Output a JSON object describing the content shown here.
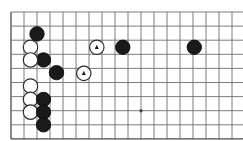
{
  "diagram": {
    "kind": "go-board-diagram",
    "board": {
      "columns": 18,
      "rows": 9,
      "origin_x": 11,
      "origin_y": 12,
      "col_spacing": 13,
      "row_spacing": 14.1,
      "line_color": "#6e6e6e",
      "edge_color": "#4a4a4a",
      "line_width": 0.9,
      "edge_width": 1.3,
      "background": "#ffffff",
      "left_edge_is_board_edge": true,
      "bottom_edge_is_board_edge": true
    },
    "colors": {
      "black_stone_fill": "#1a1a1a",
      "black_stone_edge": "#000000",
      "white_stone_fill": "#ffffff",
      "white_stone_edge": "#2b2b2b",
      "marker_color": "#1a1a1a"
    },
    "stone_radius": 7.2,
    "star_points": [
      {
        "name": "star-point-1",
        "col": 10,
        "row": 7
      }
    ],
    "stones": [
      {
        "name": "black-stone-1",
        "color": "black",
        "col": 2,
        "row": 1.55,
        "mark": "none"
      },
      {
        "name": "white-stone-1",
        "color": "white",
        "col": 1.5,
        "row": 2.5,
        "mark": "none"
      },
      {
        "name": "black-stone-2",
        "color": "black",
        "col": 2.5,
        "row": 3.4,
        "mark": "none"
      },
      {
        "name": "white-stone-2",
        "color": "white",
        "col": 1.5,
        "row": 3.4,
        "mark": "none"
      },
      {
        "name": "black-stone-3",
        "color": "black",
        "col": 3.5,
        "row": 4.3,
        "mark": "none"
      },
      {
        "name": "white-stone-marked-1",
        "color": "white",
        "col": 6.6,
        "row": 2.5,
        "mark": "triangle"
      },
      {
        "name": "black-stone-4",
        "color": "black",
        "col": 8.6,
        "row": 2.5,
        "mark": "none"
      },
      {
        "name": "black-stone-5",
        "color": "black",
        "col": 14.1,
        "row": 2.5,
        "mark": "none"
      },
      {
        "name": "white-stone-marked-2",
        "color": "white",
        "col": 5.6,
        "row": 4.35,
        "mark": "triangle"
      },
      {
        "name": "white-stone-3",
        "color": "white",
        "col": 1.5,
        "row": 5.25,
        "mark": "none"
      },
      {
        "name": "white-stone-4",
        "color": "white",
        "col": 1.5,
        "row": 6.2,
        "mark": "none"
      },
      {
        "name": "black-stone-6",
        "color": "black",
        "col": 2.5,
        "row": 6.2,
        "mark": "none"
      },
      {
        "name": "white-stone-5",
        "color": "white",
        "col": 1.5,
        "row": 7.1,
        "mark": "none"
      },
      {
        "name": "black-stone-7",
        "color": "black",
        "col": 2.5,
        "row": 7.1,
        "mark": "none"
      },
      {
        "name": "black-stone-8",
        "color": "black",
        "col": 2.5,
        "row": 8.0,
        "mark": "none"
      }
    ]
  }
}
